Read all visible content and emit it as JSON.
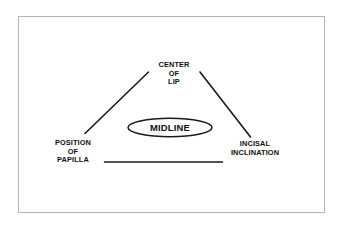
{
  "diagram": {
    "title": "MIDLINE",
    "frame": {
      "border_color": "#b4b4b4",
      "background": "#ffffff"
    },
    "line_color": "#1a1a1a",
    "center_node": {
      "label": "MIDLINE",
      "shape": "ellipse"
    },
    "nodes": [
      {
        "id": "center-of-lip",
        "label": "CENTER\nOF\nLIP",
        "position": "top"
      },
      {
        "id": "position-of-papilla",
        "label": "POSITION\nOF\nPAPILLA",
        "position": "bottom-left"
      },
      {
        "id": "incisal-inclination",
        "label": "INCISAL\nINCLINATION",
        "position": "bottom-right"
      }
    ],
    "connectors": [
      {
        "id": "center-lip-to-papilla",
        "from": "center-of-lip",
        "to": "position-of-papilla",
        "type": "diagonal"
      },
      {
        "id": "center-lip-to-incisal",
        "from": "center-of-lip",
        "to": "incisal-inclination",
        "type": "diagonal"
      },
      {
        "id": "papilla-to-incisal",
        "from": "position-of-papilla",
        "to": "incisal-inclination",
        "type": "horizontal"
      }
    ]
  }
}
